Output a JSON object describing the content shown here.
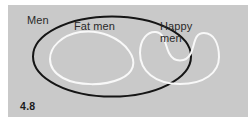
{
  "figure": {
    "number": "4.8",
    "type": "venn-diagram",
    "panel_background": "#c9c9c9",
    "page_background": "#ffffff"
  },
  "sets": {
    "universe": {
      "label": "Men",
      "shape": "ellipse",
      "stroke_color": "#151515",
      "stroke_width": 2,
      "fill": "none",
      "label_position": "outside-top-left"
    },
    "subsets": [
      {
        "label": "Fat men",
        "shape": "rounded-triangular-blob",
        "stroke_color": "#f8f8f8",
        "stroke_width": 2,
        "fill": "none",
        "label_position": "inside-top"
      },
      {
        "label": "Happy men",
        "label_lines": [
          "Happy",
          "men"
        ],
        "shape": "kidney-crescent-blob",
        "stroke_color": "#f8f8f8",
        "stroke_width": 2,
        "fill": "none",
        "label_position": "inside-top"
      }
    ]
  },
  "relations": {
    "description": "Fat men and Happy men are disjoint subsets of Men"
  }
}
